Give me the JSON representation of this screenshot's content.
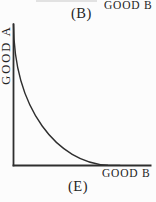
{
  "figure": {
    "top_panel": {
      "x_axis_label": "GOOD B",
      "caption": "(B)"
    },
    "bottom_panel": {
      "y_axis_label": "GOOD A",
      "x_axis_label": "GOOD B",
      "caption": "(E)"
    },
    "curve_description": "convex-to-origin downward curve from top of y-axis to x-axis"
  },
  "colors": {
    "background": "#fcfcfc",
    "line": "#2e2e2e",
    "text": "#242424",
    "cropped_edge_line": "#e2e2e2"
  }
}
